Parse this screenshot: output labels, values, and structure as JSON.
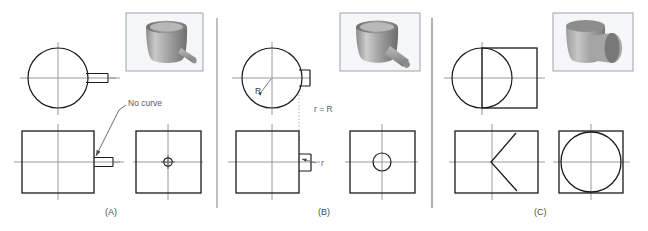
{
  "figure": {
    "type": "engineering-drawing",
    "background": "#ffffff",
    "object_line_color": "#1a1a1a",
    "center_line_color": "#8c8c8c",
    "annotation_color": "#5c5c5c",
    "thumbnail_border_color": "#9aa3ad",
    "divider_color": "#b5b5b5"
  },
  "panels": [
    {
      "id": "A",
      "caption": "(A)",
      "annotations": [
        {
          "name": "no-curve",
          "text": "No curve"
        }
      ],
      "thumbnail": {
        "name": "cylinder-with-small-rod-pictorial"
      }
    },
    {
      "id": "B",
      "caption": "(B)",
      "annotations": [
        {
          "name": "radius-major",
          "text": "R"
        },
        {
          "name": "radius-equality",
          "text": "r = R"
        },
        {
          "name": "radius-minor",
          "text": "r"
        }
      ],
      "thumbnail": {
        "name": "cylinder-with-medium-rod-pictorial"
      }
    },
    {
      "id": "C",
      "caption": "(C)",
      "annotations": [],
      "thumbnail": {
        "name": "two-equal-cylinders-pictorial"
      }
    }
  ]
}
